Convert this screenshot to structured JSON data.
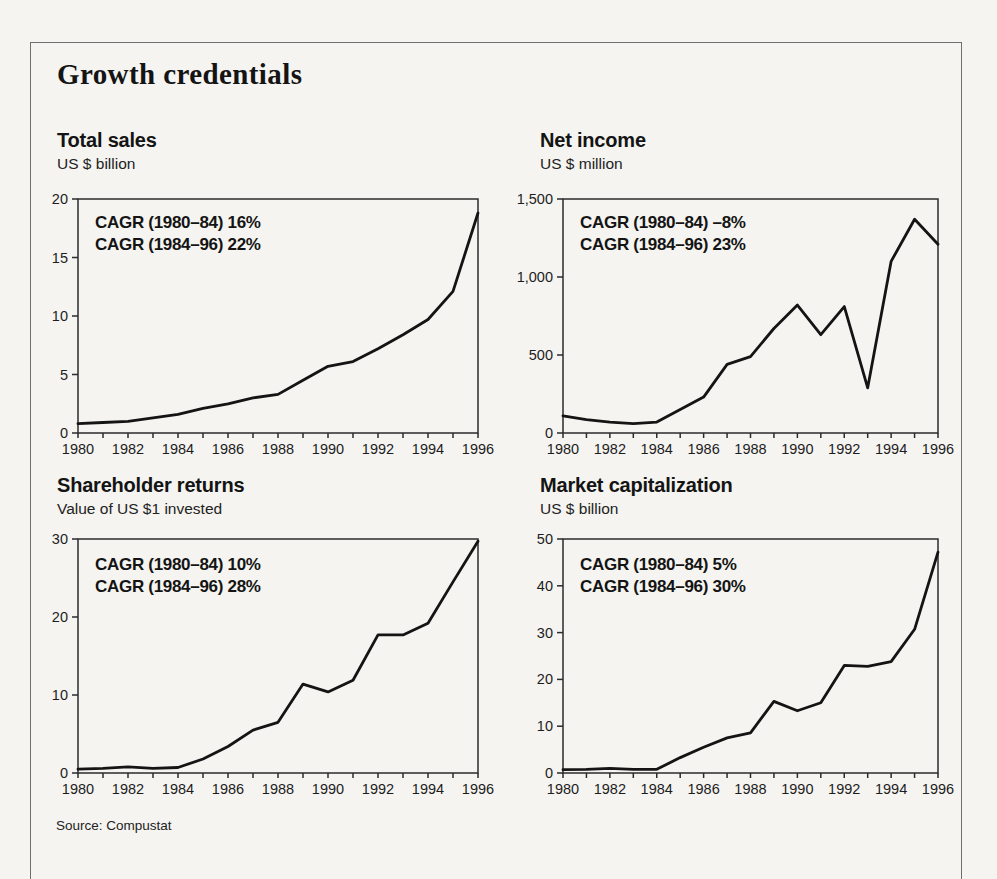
{
  "figure": {
    "title": "Growth credentials",
    "source": "Source: Compustat"
  },
  "chart_data": [
    {
      "type": "line",
      "title": "Total sales",
      "subtitle": "US $ billion",
      "ylabel": "US $ billion",
      "xlabel": "",
      "annotations": [
        "CAGR (1980–84) 16%",
        "CAGR (1984–96) 22%"
      ],
      "x": [
        1980,
        1981,
        1982,
        1983,
        1984,
        1985,
        1986,
        1987,
        1988,
        1989,
        1990,
        1991,
        1992,
        1993,
        1994,
        1995,
        1996
      ],
      "values": [
        0.8,
        0.9,
        1.0,
        1.3,
        1.6,
        2.1,
        2.5,
        3.0,
        3.3,
        4.5,
        5.7,
        6.1,
        7.2,
        8.4,
        9.7,
        12.1,
        18.8
      ],
      "ylim": [
        0,
        20
      ],
      "yticks": [
        0,
        5,
        10,
        15,
        20
      ],
      "ytick_labels": [
        "0",
        "5",
        "10",
        "15",
        "20"
      ],
      "xtick_label_years": [
        1980,
        1982,
        1984,
        1986,
        1988,
        1990,
        1992,
        1994,
        1996
      ],
      "grid": false,
      "legend": "none"
    },
    {
      "type": "line",
      "title": "Net income",
      "subtitle": "US $ million",
      "ylabel": "US $ million",
      "xlabel": "",
      "annotations": [
        "CAGR (1980–84) –8%",
        "CAGR (1984–96) 23%"
      ],
      "x": [
        1980,
        1981,
        1982,
        1983,
        1984,
        1985,
        1986,
        1987,
        1988,
        1989,
        1990,
        1991,
        1992,
        1993,
        1994,
        1995,
        1996
      ],
      "values": [
        110,
        85,
        70,
        60,
        70,
        150,
        230,
        440,
        490,
        670,
        820,
        630,
        810,
        290,
        1100,
        1370,
        1210
      ],
      "ylim": [
        0,
        1500
      ],
      "yticks": [
        0,
        500,
        1000,
        1500
      ],
      "ytick_labels": [
        "0",
        "500",
        "1,000",
        "1,500"
      ],
      "xtick_label_years": [
        1980,
        1982,
        1984,
        1986,
        1988,
        1990,
        1992,
        1994,
        1996
      ],
      "grid": false,
      "legend": "none"
    },
    {
      "type": "line",
      "title": "Shareholder returns",
      "subtitle": "Value of US $1 invested",
      "ylabel": "Value of US $1 invested",
      "xlabel": "",
      "annotations": [
        "CAGR (1980–84) 10%",
        "CAGR (1984–96) 28%"
      ],
      "x": [
        1980,
        1981,
        1982,
        1983,
        1984,
        1985,
        1986,
        1987,
        1988,
        1989,
        1990,
        1991,
        1992,
        1993,
        1994,
        1995,
        1996
      ],
      "values": [
        0.5,
        0.6,
        0.8,
        0.6,
        0.7,
        1.8,
        3.4,
        5.5,
        6.5,
        11.4,
        10.4,
        11.9,
        17.7,
        17.7,
        19.2,
        24.5,
        29.7
      ],
      "ylim": [
        0,
        30
      ],
      "yticks": [
        0,
        10,
        20,
        30
      ],
      "ytick_labels": [
        "0",
        "10",
        "20",
        "30"
      ],
      "xtick_label_years": [
        1980,
        1982,
        1984,
        1986,
        1988,
        1990,
        1992,
        1994,
        1996
      ],
      "grid": false,
      "legend": "none"
    },
    {
      "type": "line",
      "title": "Market capitalization",
      "subtitle": "US $ billion",
      "ylabel": "US $ billion",
      "xlabel": "",
      "annotations": [
        "CAGR (1980–84) 5%",
        "CAGR (1984–96) 30%"
      ],
      "x": [
        1980,
        1981,
        1982,
        1983,
        1984,
        1985,
        1986,
        1987,
        1988,
        1989,
        1990,
        1991,
        1992,
        1993,
        1994,
        1995,
        1996
      ],
      "values": [
        0.7,
        0.8,
        1.0,
        0.8,
        0.8,
        3.3,
        5.5,
        7.5,
        8.6,
        15.3,
        13.3,
        15.0,
        23.0,
        22.8,
        23.8,
        30.7,
        47.2
      ],
      "ylim": [
        0,
        50
      ],
      "yticks": [
        0,
        10,
        20,
        30,
        40,
        50
      ],
      "ytick_labels": [
        "0",
        "10",
        "20",
        "30",
        "40",
        "50"
      ],
      "xtick_label_years": [
        1980,
        1982,
        1984,
        1986,
        1988,
        1990,
        1992,
        1994,
        1996
      ],
      "grid": false,
      "legend": "none"
    }
  ]
}
